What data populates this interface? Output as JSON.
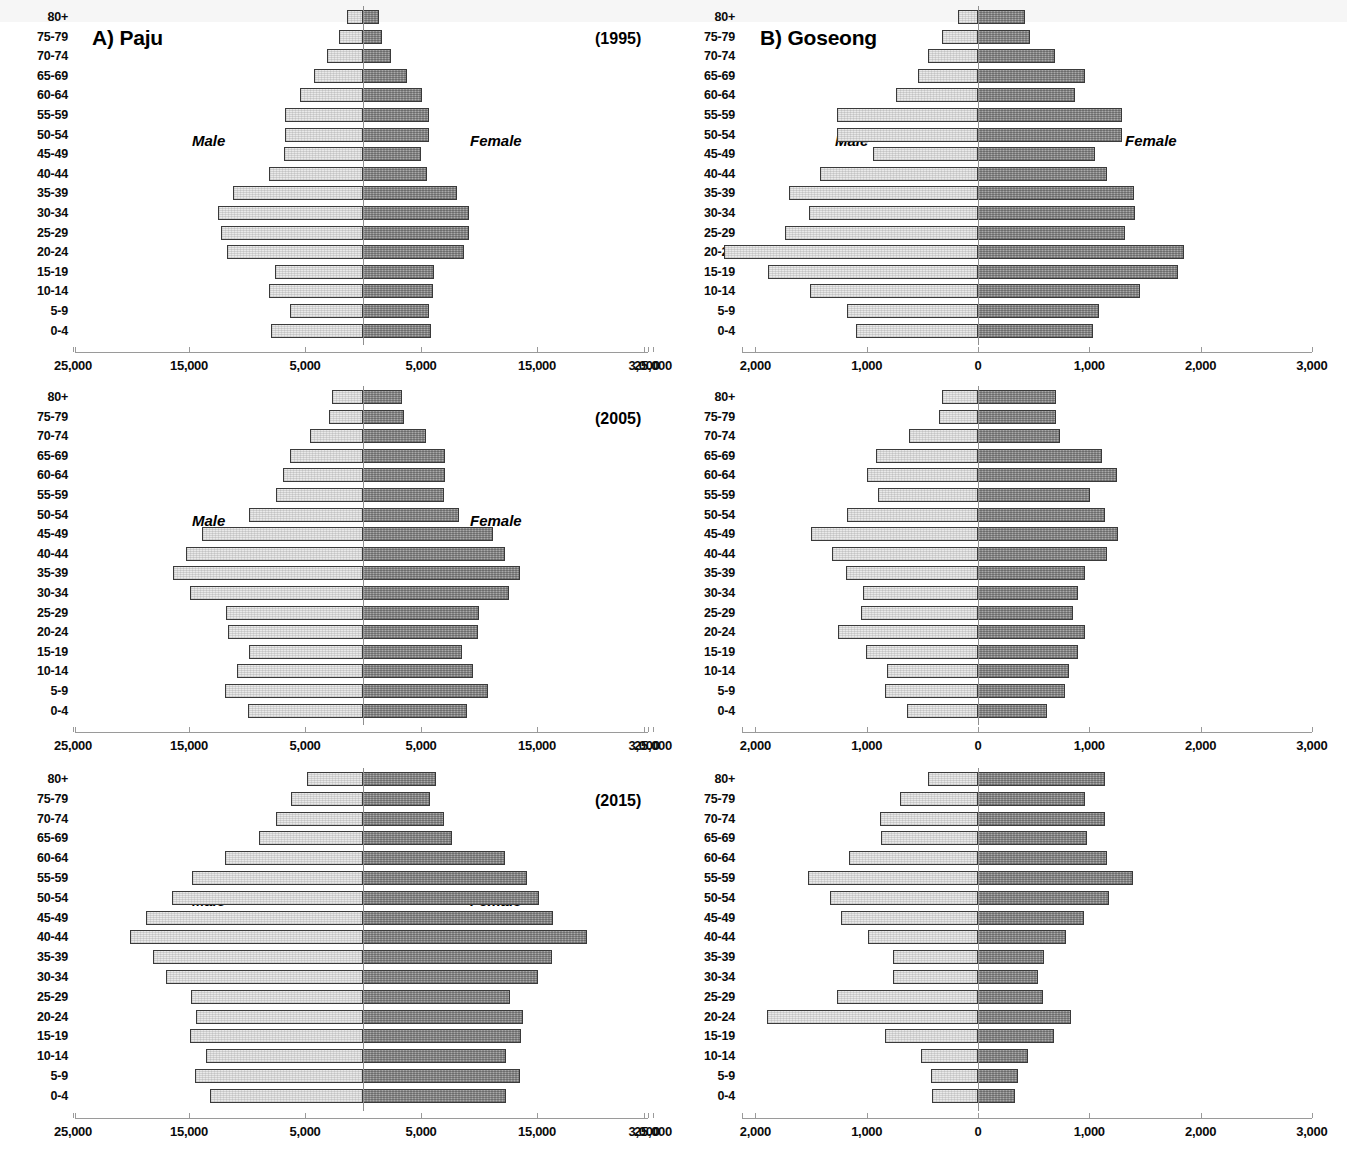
{
  "figure": {
    "panels": [
      {
        "id": "paju-1995",
        "title": "A) Paju",
        "year": "(1995)",
        "region": "Paju"
      },
      {
        "id": "paju-2005",
        "title": "",
        "year": "(2005)",
        "region": "Paju"
      },
      {
        "id": "paju-2015",
        "title": "",
        "year": "(2015)",
        "region": "Paju"
      },
      {
        "id": "goseong-1995",
        "title": "B) Goseong",
        "year": "",
        "region": "Goseong"
      },
      {
        "id": "goseong-2005",
        "title": "",
        "year": "",
        "region": "Goseong"
      },
      {
        "id": "goseong-2015",
        "title": "",
        "year": "",
        "region": "Goseong"
      }
    ],
    "male_label": "Male",
    "female_label": "Female",
    "colors": {
      "male": "#e9e9e9",
      "female": "#8d8d8d",
      "border": "#3a3a3a",
      "axis": "#9a9a9a"
    }
  },
  "chart_data": [
    {
      "type": "bar",
      "subtype": "population-pyramid",
      "title": "A) Paju",
      "annotation": "(1995)",
      "xlabel": "",
      "ylabel": "",
      "categories": [
        "0-4",
        "5-9",
        "10-14",
        "15-19",
        "20-24",
        "25-29",
        "30-34",
        "35-39",
        "40-44",
        "45-49",
        "50-54",
        "55-59",
        "60-64",
        "65-69",
        "70-74",
        "75-79",
        "80+"
      ],
      "xlim": [
        -25000,
        25000
      ],
      "xticks": [
        -25000,
        -15000,
        -5000,
        5000,
        15000,
        25000
      ],
      "xticklabels": [
        "25,000",
        "15,000",
        "5,000",
        "5,000",
        "15,000",
        "25,000"
      ],
      "grid": false,
      "legend": [
        "Male",
        "Female"
      ],
      "legend_position": "inside-left-and-right",
      "series": [
        {
          "name": "Male",
          "side": "left",
          "values": [
            7900,
            6300,
            8100,
            7600,
            11700,
            12200,
            12500,
            11200,
            8100,
            6800,
            6700,
            6700,
            5400,
            4200,
            3100,
            2100,
            1400
          ]
        },
        {
          "name": "Female",
          "side": "right",
          "values": [
            5900,
            5700,
            6000,
            6100,
            8700,
            9100,
            9100,
            8100,
            5500,
            5000,
            5700,
            5700,
            5100,
            3800,
            2400,
            1600,
            1400
          ]
        }
      ]
    },
    {
      "type": "bar",
      "subtype": "population-pyramid",
      "title": "",
      "annotation": "(2005)",
      "xlabel": "",
      "ylabel": "",
      "categories": [
        "0-4",
        "5-9",
        "10-14",
        "15-19",
        "20-24",
        "25-29",
        "30-34",
        "35-39",
        "40-44",
        "45-49",
        "50-54",
        "55-59",
        "60-64",
        "65-69",
        "70-74",
        "75-79",
        "80+"
      ],
      "xlim": [
        -25000,
        25000
      ],
      "xticks": [
        -25000,
        -15000,
        -5000,
        5000,
        15000,
        25000
      ],
      "xticklabels": [
        "25,000",
        "15,000",
        "5,000",
        "5,000",
        "15,000",
        "25,000"
      ],
      "grid": false,
      "legend": [
        "Male",
        "Female"
      ],
      "legend_position": "inside-left-and-right",
      "series": [
        {
          "name": "Male",
          "side": "left",
          "values": [
            9900,
            11900,
            10900,
            9800,
            11600,
            11800,
            14900,
            16400,
            15300,
            13900,
            9800,
            7500,
            6900,
            6300,
            4600,
            2900,
            2700
          ]
        },
        {
          "name": "Female",
          "side": "right",
          "values": [
            9000,
            10800,
            9500,
            8500,
            9900,
            10000,
            12600,
            13500,
            12200,
            11200,
            8300,
            7000,
            7100,
            7100,
            5400,
            3500,
            3400
          ]
        }
      ]
    },
    {
      "type": "bar",
      "subtype": "population-pyramid",
      "title": "",
      "annotation": "(2015)",
      "xlabel": "",
      "ylabel": "",
      "categories": [
        "0-4",
        "5-9",
        "10-14",
        "15-19",
        "20-24",
        "25-29",
        "30-34",
        "35-39",
        "40-44",
        "45-49",
        "50-54",
        "55-59",
        "60-64",
        "65-69",
        "70-74",
        "75-79",
        "80+"
      ],
      "xlim": [
        -25000,
        25000
      ],
      "xticks": [
        -25000,
        -15000,
        -5000,
        5000,
        15000,
        25000
      ],
      "xticklabels": [
        "25,000",
        "15,000",
        "5,000",
        "5,000",
        "15,000",
        "25,000"
      ],
      "grid": false,
      "legend": [
        "Male",
        "Female"
      ],
      "legend_position": "inside-left-and-right",
      "series": [
        {
          "name": "Male",
          "side": "left",
          "values": [
            13200,
            14500,
            13500,
            14900,
            14400,
            14800,
            17000,
            18100,
            20100,
            18700,
            16500,
            14700,
            11900,
            9000,
            7500,
            6200,
            4800
          ]
        },
        {
          "name": "Female",
          "side": "right",
          "values": [
            12300,
            13500,
            12300,
            13600,
            13800,
            12700,
            15100,
            16300,
            19300,
            16400,
            15200,
            14100,
            12200,
            7700,
            7000,
            5800,
            6300
          ]
        }
      ]
    },
    {
      "type": "bar",
      "subtype": "population-pyramid",
      "title": "B) Goseong",
      "annotation": "",
      "xlabel": "",
      "ylabel": "",
      "categories": [
        "0-4",
        "5-9",
        "10-14",
        "15-19",
        "20-24",
        "25-29",
        "30-34",
        "35-39",
        "40-44",
        "45-49",
        "50-54",
        "55-59",
        "60-64",
        "65-69",
        "70-74",
        "75-79",
        "80+"
      ],
      "xlim": [
        -3000,
        3000
      ],
      "xticks": [
        -3000,
        -2000,
        -1000,
        0,
        1000,
        2000,
        3000
      ],
      "xticklabels": [
        "3,000",
        "2,000",
        "1,000",
        "0",
        "1,000",
        "2,000",
        "3,000"
      ],
      "grid": false,
      "legend": [
        "Male",
        "Female"
      ],
      "legend_position": "inside-left-and-right",
      "series": [
        {
          "name": "Male",
          "side": "left",
          "values": [
            1100,
            1180,
            1510,
            1890,
            2280,
            1730,
            1520,
            1700,
            1420,
            940,
            1270,
            1270,
            740,
            540,
            450,
            320,
            180
          ]
        },
        {
          "name": "Female",
          "side": "right",
          "values": [
            1030,
            1090,
            1460,
            1800,
            1850,
            1320,
            1410,
            1400,
            1160,
            1050,
            1290,
            1290,
            870,
            960,
            690,
            470,
            420
          ]
        }
      ]
    },
    {
      "type": "bar",
      "subtype": "population-pyramid",
      "title": "",
      "annotation": "",
      "xlabel": "",
      "ylabel": "",
      "categories": [
        "0-4",
        "5-9",
        "10-14",
        "15-19",
        "20-24",
        "25-29",
        "30-34",
        "35-39",
        "40-44",
        "45-49",
        "50-54",
        "55-59",
        "60-64",
        "65-69",
        "70-74",
        "75-79",
        "80+"
      ],
      "xlim": [
        -3000,
        3000
      ],
      "xticks": [
        -3000,
        -2000,
        -1000,
        0,
        1000,
        2000,
        3000
      ],
      "xticklabels": [
        "3,000",
        "2,000",
        "1,000",
        "0",
        "1,000",
        "2,000",
        "3,000"
      ],
      "grid": false,
      "legend": [
        "Male",
        "Female"
      ],
      "legend_position": "inside-left-and-right",
      "series": [
        {
          "name": "Male",
          "side": "left",
          "values": [
            640,
            840,
            820,
            1010,
            1260,
            1050,
            1030,
            1190,
            1310,
            1500,
            1180,
            900,
            1000,
            920,
            620,
            350,
            320
          ]
        },
        {
          "name": "Female",
          "side": "right",
          "values": [
            620,
            780,
            820,
            900,
            960,
            850,
            900,
            960,
            1160,
            1260,
            1140,
            1010,
            1250,
            1110,
            740,
            700,
            700
          ]
        }
      ]
    },
    {
      "type": "bar",
      "subtype": "population-pyramid",
      "title": "",
      "annotation": "",
      "xlabel": "",
      "ylabel": "",
      "categories": [
        "0-4",
        "5-9",
        "10-14",
        "15-19",
        "20-24",
        "25-29",
        "30-34",
        "35-39",
        "40-44",
        "45-49",
        "50-54",
        "55-59",
        "60-64",
        "65-69",
        "70-74",
        "75-79",
        "80+"
      ],
      "xlim": [
        -3000,
        3000
      ],
      "xticks": [
        -3000,
        -2000,
        -1000,
        0,
        1000,
        2000,
        3000
      ],
      "xticklabels": [
        "3,000",
        "2,000",
        "1,000",
        "0",
        "1,000",
        "2,000",
        "3,000"
      ],
      "grid": false,
      "legend": [
        "Male",
        "Female"
      ],
      "legend_position": "inside-left-and-right",
      "series": [
        {
          "name": "Male",
          "side": "left",
          "values": [
            410,
            420,
            510,
            840,
            1900,
            1270,
            760,
            760,
            990,
            1230,
            1330,
            1530,
            1160,
            870,
            880,
            700,
            450
          ]
        },
        {
          "name": "Female",
          "side": "right",
          "values": [
            330,
            360,
            450,
            680,
            840,
            580,
            540,
            590,
            790,
            950,
            1180,
            1390,
            1160,
            980,
            1140,
            960,
            1140
          ]
        }
      ]
    }
  ]
}
